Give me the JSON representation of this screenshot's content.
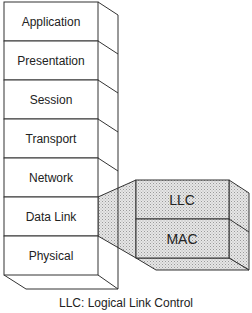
{
  "diagram": {
    "layers": [
      {
        "name": "Application"
      },
      {
        "name": "Presentation"
      },
      {
        "name": "Session"
      },
      {
        "name": "Transport"
      },
      {
        "name": "Network"
      },
      {
        "name": "Data Link"
      },
      {
        "name": "Physical"
      }
    ],
    "sublayers": [
      {
        "name": "LLC"
      },
      {
        "name": "MAC"
      }
    ],
    "caption": "LLC: Logical Link Control",
    "colors": {
      "line": "#333333",
      "shade": "#d9d9d9"
    }
  }
}
